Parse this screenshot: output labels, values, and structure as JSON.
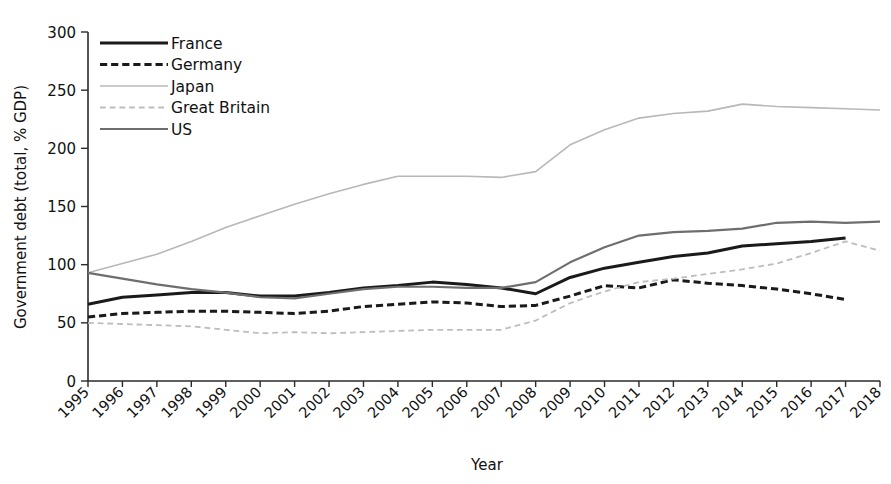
{
  "chart_data": {
    "type": "line",
    "title": "",
    "xlabel": "Year",
    "ylabel": "Government debt (total, % GDP)",
    "x": [
      1995,
      1996,
      1997,
      1998,
      1999,
      2000,
      2001,
      2002,
      2003,
      2004,
      2005,
      2006,
      2007,
      2008,
      2009,
      2010,
      2011,
      2012,
      2013,
      2014,
      2015,
      2016,
      2017,
      2018
    ],
    "xlim": [
      1995,
      2018
    ],
    "ylim": [
      0,
      300
    ],
    "yticks": [
      0,
      50,
      100,
      150,
      200,
      250,
      300
    ],
    "xticks": [
      "1995",
      "1996",
      "1997",
      "1998",
      "1999",
      "2000",
      "2001",
      "2002",
      "2003",
      "2004",
      "2005",
      "2006",
      "2007",
      "2008",
      "2009",
      "2010",
      "2011",
      "2012",
      "2013",
      "2014",
      "2015",
      "2016",
      "2017",
      "2018"
    ],
    "grid": false,
    "legend_position": "top-left",
    "series": [
      {
        "name": "France",
        "style": "solid",
        "color": "#1a1a1a",
        "width": 3.0,
        "values": [
          66,
          72,
          74,
          76,
          76,
          73,
          73,
          76,
          80,
          82,
          85,
          83,
          80,
          75,
          89,
          97,
          102,
          107,
          110,
          116,
          118,
          120,
          123,
          null
        ]
      },
      {
        "name": "Germany",
        "style": "dashed",
        "color": "#1a1a1a",
        "width": 3.0,
        "values": [
          55,
          58,
          59,
          60,
          60,
          59,
          58,
          60,
          64,
          66,
          68,
          67,
          64,
          65,
          73,
          82,
          80,
          87,
          84,
          82,
          79,
          75,
          70,
          null
        ]
      },
      {
        "name": "Japan",
        "style": "solid",
        "color": "#b8b8b8",
        "width": 1.6,
        "values": [
          93,
          101,
          109,
          120,
          132,
          142,
          152,
          161,
          169,
          176,
          176,
          176,
          175,
          180,
          203,
          216,
          226,
          230,
          232,
          238,
          236,
          235,
          234,
          233
        ]
      },
      {
        "name": "Great Britain",
        "style": "dashed",
        "color": "#bdbdbd",
        "width": 1.8,
        "values": [
          50,
          49,
          48,
          47,
          44,
          41,
          42,
          41,
          42,
          43,
          44,
          44,
          44,
          52,
          67,
          77,
          85,
          88,
          92,
          96,
          101,
          110,
          120,
          112
        ]
      },
      {
        "name": "US",
        "style": "solid",
        "color": "#6e6e6e",
        "width": 2.2,
        "values": [
          93,
          88,
          83,
          79,
          76,
          72,
          71,
          75,
          79,
          81,
          81,
          80,
          80,
          85,
          102,
          115,
          125,
          128,
          129,
          131,
          136,
          137,
          136,
          137
        ]
      }
    ]
  },
  "legend": {
    "items": [
      {
        "label": "France"
      },
      {
        "label": "Germany"
      },
      {
        "label": "Japan"
      },
      {
        "label": "Great Britain"
      },
      {
        "label": "US"
      }
    ]
  }
}
